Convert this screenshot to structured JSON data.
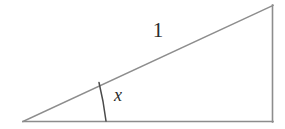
{
  "figure": {
    "background_color": "#ffffff",
    "stroke_color": "#8a8a8a",
    "arc_color": "#4a4a4a",
    "text_color": "#2b2b2b",
    "labels": {
      "hypotenuse": "1",
      "angle": "x"
    },
    "geometry": {
      "left_vertex": "23,122",
      "bottom_right_vertex": "273,122",
      "top_right_vertex": "273,5",
      "base_path": "M 23 121.5 L 273 121.5",
      "hypotenuse_path": "M 23 121.5 L 273 5.5",
      "vertical_path": "M 272.5 5 L 272.5 122",
      "angle_arc_path": "M 99 82.5 Q 103.5 101 106 121",
      "angle_degrees": 25
    }
  },
  "chart_data": {
    "type": "diagram",
    "shape": "right triangle",
    "vertices": [
      {
        "name": "left-acute-vertex",
        "x": 23,
        "y": 122
      },
      {
        "name": "bottom-right-vertex",
        "x": 273,
        "y": 122
      },
      {
        "name": "top-right-vertex",
        "x": 273,
        "y": 5
      }
    ],
    "edges": [
      {
        "name": "base",
        "from": "left-acute-vertex",
        "to": "bottom-right-vertex",
        "label": ""
      },
      {
        "name": "hypotenuse",
        "from": "left-acute-vertex",
        "to": "top-right-vertex",
        "label": "1"
      },
      {
        "name": "opposite-side",
        "from": "bottom-right-vertex",
        "to": "top-right-vertex",
        "label": ""
      }
    ],
    "angles": [
      {
        "at": "left-acute-vertex",
        "label": "x",
        "marked": true,
        "degrees": 25
      },
      {
        "at": "bottom-right-vertex",
        "label": "",
        "marked": false,
        "degrees": 90
      }
    ],
    "legend": [],
    "grid": false
  }
}
